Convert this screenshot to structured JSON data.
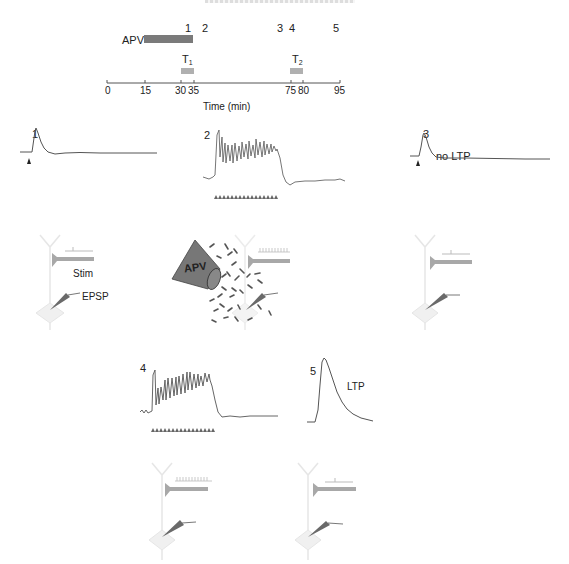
{
  "figure": {
    "title_cropped": "",
    "timeline": {
      "axis_label": "Time (min)",
      "ticks": [
        "0",
        "15",
        "30",
        "35",
        "75",
        "80",
        "95"
      ],
      "tick_minutes": [
        0,
        15,
        30,
        35,
        75,
        80,
        95
      ],
      "drug_bar": {
        "label": "APV",
        "start": 15,
        "end": 35,
        "color": "#7a7a7a"
      },
      "tetanus_bars": [
        {
          "label": "T",
          "subscript": "1",
          "start": 30,
          "end": 35,
          "color": "#b0b0b0"
        },
        {
          "label": "T",
          "subscript": "2",
          "start": 75,
          "end": 80,
          "color": "#b0b0b0"
        }
      ],
      "sample_markers": [
        {
          "label": "1",
          "time": 28
        },
        {
          "label": "2",
          "time": 34
        },
        {
          "label": "3",
          "time": 74
        },
        {
          "label": "4",
          "time": 78
        },
        {
          "label": "5",
          "time": 94
        }
      ]
    },
    "panels": [
      {
        "id": "1",
        "label": "1",
        "trace": "single EPSP",
        "annotation": "",
        "stimulus": "single arrowhead"
      },
      {
        "id": "2",
        "label": "2",
        "trace": "tetanic response under APV",
        "annotation": "",
        "stimulus": "train of arrowheads"
      },
      {
        "id": "3",
        "label": "3",
        "trace": "single EPSP",
        "annotation": "no LTP",
        "stimulus": "single arrowhead"
      },
      {
        "id": "4",
        "label": "4",
        "trace": "tetanic response",
        "annotation": "",
        "stimulus": "train of arrowheads"
      },
      {
        "id": "5",
        "label": "5",
        "trace": "potentiated EPSP",
        "annotation": "LTP",
        "stimulus": ""
      }
    ],
    "schematics": {
      "stim_label": "Stim",
      "epsp_label": "EPSP",
      "apv_label": "APV"
    },
    "colors": {
      "trace": "#555555",
      "axon": "#a8a8a8",
      "electrode": "#6a6a6a",
      "apv_cone": "#777777",
      "neuron_outline": "#e6e6e6"
    }
  }
}
